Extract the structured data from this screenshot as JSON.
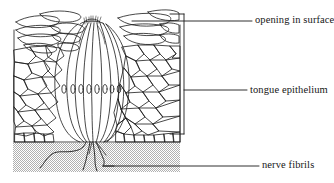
{
  "figure": {
    "type": "histological-cross-section",
    "background_color": "#ffffff",
    "ink_color": "#1a1a1a",
    "stipple_color": "#b9b9b9"
  },
  "labels": {
    "opening": "opening in surface",
    "epithelium": "tongue epithelium",
    "nerve": "nerve fibrils"
  },
  "leaders": {
    "opening": {
      "x1": 132,
      "y1": 21,
      "x2": 252,
      "y2": 21
    },
    "epithelium": {
      "x1": 184,
      "y1": 90,
      "x2": 247,
      "y2": 90
    },
    "nerve": {
      "x1": 103,
      "y1": 166,
      "x2": 259,
      "y2": 166
    }
  },
  "bracket": {
    "x": 184,
    "y_top": 14,
    "y_bottom": 134,
    "arm_length": 14
  },
  "regions": {
    "epithelium": {
      "x": 13,
      "y": 10,
      "width": 167,
      "height": 133
    },
    "connective_tissue": {
      "x": 13,
      "y": 143,
      "width": 167,
      "height": 29,
      "fill": "stipple-gray"
    }
  },
  "taste_bud": {
    "center_x": 92,
    "top_y": 22,
    "bottom_y": 142,
    "half_width": 40,
    "cell_count": 11,
    "nuclei_count": 8,
    "nuclei_row_y": 89
  },
  "nerve_fibrils": {
    "branch_origin": {
      "x": 92,
      "y": 142
    },
    "branch_count": 4
  }
}
